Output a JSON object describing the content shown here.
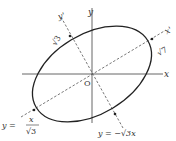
{
  "diagram": {
    "type": "rotated-ellipse",
    "axes": {
      "x_label": "x",
      "y_label": "y",
      "origin_label": "O",
      "x_prime_label": "x'",
      "y_prime_label": "y'"
    },
    "annotations": {
      "minor_semi_axis": "√3",
      "major_semi_axis": "√7",
      "x_prime_line_lhs": "y =",
      "x_prime_line_num": "x",
      "x_prime_line_den": "√3",
      "y_prime_line": "y = −√3x"
    },
    "colors": {
      "curve": "#222222",
      "axis": "#555555",
      "dashed": "#555555",
      "text": "#333333"
    }
  }
}
